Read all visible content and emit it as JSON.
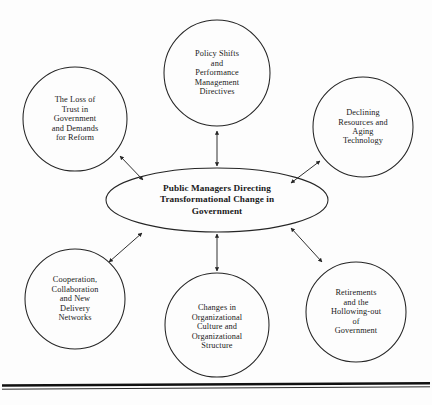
{
  "diagram": {
    "type": "hub-and-spoke concept diagram",
    "center": {
      "id": "center-hub",
      "text": "Public Managers Directing\nTransformational Change in\nGovernment",
      "shape": "ellipse",
      "cx": 217,
      "cy": 200,
      "rx": 111,
      "ry": 32
    },
    "satellites": [
      {
        "id": "policy-shifts",
        "text": "Policy Shifts\nand\nPerformance\nManagement\nDirectives",
        "shape": "circle",
        "cx": 217,
        "cy": 73,
        "r": 53,
        "position": "top-center"
      },
      {
        "id": "loss-of-trust",
        "text": "The Loss of\nTrust in\nGovernment\nand Demands\nfor Reform",
        "shape": "circle",
        "cx": 75,
        "cy": 119,
        "r": 52,
        "position": "top-left"
      },
      {
        "id": "declining-resources",
        "text": "Declining\nResources and\nAging\nTechnology",
        "shape": "circle",
        "cx": 363,
        "cy": 127,
        "r": 50,
        "position": "top-right"
      },
      {
        "id": "cooperation-collaboration",
        "text": "Cooperation,\nCollaboration\nand New\nDelivery\nNetworks",
        "shape": "circle",
        "cx": 75,
        "cy": 299,
        "r": 50,
        "position": "bottom-left"
      },
      {
        "id": "organizational-change",
        "text": "Changes in\nOrganizational\nCulture and\nOrganizational\nStructure",
        "shape": "circle",
        "cx": 217,
        "cy": 325,
        "r": 52,
        "position": "bottom-center"
      },
      {
        "id": "retirements-hollowing-out",
        "text": "Retirements\nand the\nHollowing-out\nof\nGovernment",
        "shape": "circle",
        "cx": 356,
        "cy": 312,
        "r": 50,
        "position": "bottom-right"
      }
    ],
    "connectors": [
      {
        "id": "connector-policy-shifts",
        "from": "center-hub",
        "to": "policy-shifts",
        "style": "double-headed-arrow"
      },
      {
        "id": "connector-loss-of-trust",
        "from": "center-hub",
        "to": "loss-of-trust",
        "style": "double-headed-arrow"
      },
      {
        "id": "connector-declining-resources",
        "from": "center-hub",
        "to": "declining-resources",
        "style": "double-headed-arrow"
      },
      {
        "id": "connector-cooperation",
        "from": "center-hub",
        "to": "cooperation-collaboration",
        "style": "double-headed-arrow"
      },
      {
        "id": "connector-organizational-change",
        "from": "center-hub",
        "to": "organizational-change",
        "style": "double-headed-arrow"
      },
      {
        "id": "connector-retirements",
        "from": "center-hub",
        "to": "retirements-hollowing-out",
        "style": "double-headed-arrow"
      }
    ],
    "footer_rule": {
      "id": "footer-rule",
      "visible": true
    }
  },
  "colors": {
    "background": "#fdfdfd",
    "stroke": "#252525",
    "text": "#1a1a1a",
    "rule": "#111111"
  }
}
